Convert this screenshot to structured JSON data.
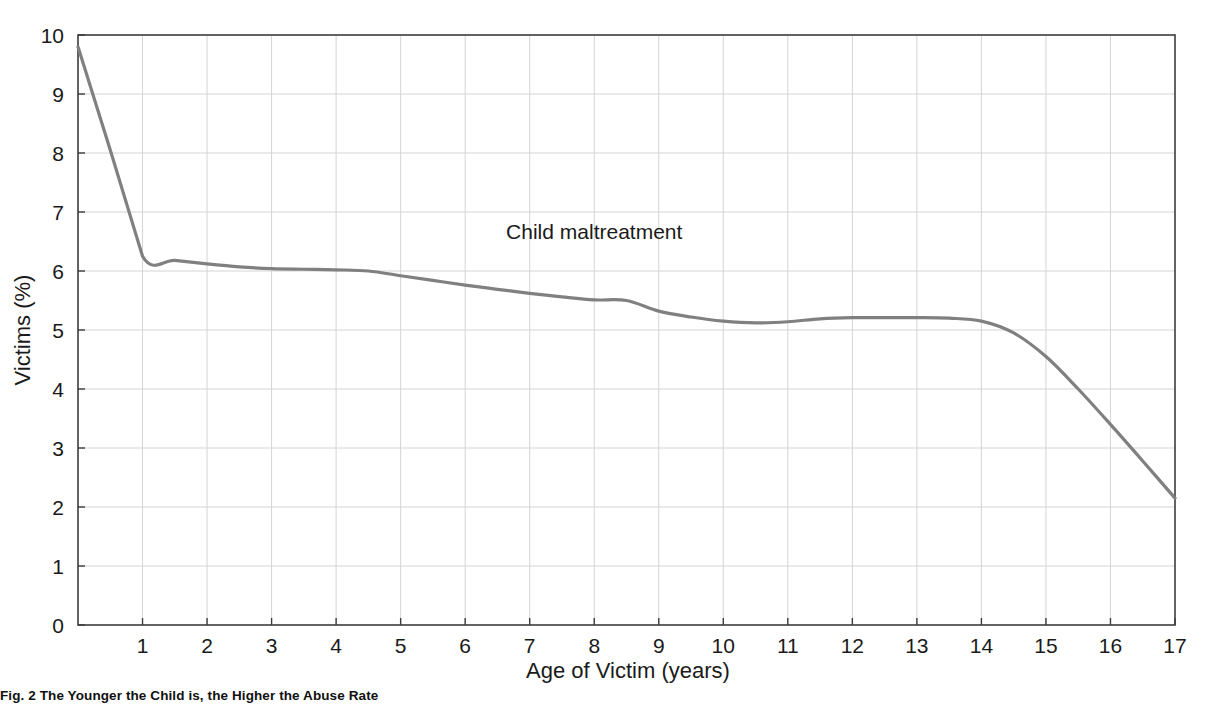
{
  "chart_data": {
    "type": "line",
    "title": "",
    "xlabel": "Age of Victim (years)",
    "ylabel": "Victims (%)",
    "xlim": [
      0,
      17
    ],
    "ylim": [
      0,
      10
    ],
    "xticks": [
      1,
      2,
      3,
      4,
      5,
      6,
      7,
      8,
      9,
      10,
      11,
      12,
      13,
      14,
      15,
      16,
      17
    ],
    "yticks": [
      0,
      1,
      2,
      3,
      4,
      5,
      6,
      7,
      8,
      9,
      10
    ],
    "grid": true,
    "legend_position": "inline-annotation",
    "series": [
      {
        "name": "Child maltreatment",
        "color": "#808080",
        "x": [
          0,
          0.5,
          1,
          1.5,
          2,
          2.5,
          3,
          3.5,
          4,
          4.5,
          5,
          5.5,
          6,
          6.5,
          7,
          7.5,
          8,
          8.5,
          9,
          9.5,
          10,
          10.5,
          11,
          11.5,
          12,
          12.5,
          13,
          13.5,
          14,
          14.5,
          15,
          15.5,
          16,
          16.5,
          17
        ],
        "y": [
          9.8,
          8.05,
          6.25,
          6.18,
          6.12,
          6.07,
          6.04,
          6.03,
          6.02,
          6.0,
          5.92,
          5.84,
          5.76,
          5.69,
          5.62,
          5.56,
          5.51,
          5.5,
          5.32,
          5.22,
          5.15,
          5.12,
          5.14,
          5.19,
          5.21,
          5.21,
          5.21,
          5.2,
          5.15,
          4.95,
          4.55,
          4.0,
          3.4,
          2.78,
          2.15
        ]
      }
    ],
    "annotations": [
      {
        "text": "Child maltreatment",
        "x": 8.0,
        "y": 6.55
      }
    ]
  },
  "figure": {
    "caption": "Fig. 2    The Younger the Child is, the Higher the Abuse Rate"
  },
  "axis": {
    "x_title": "Age of Victim (years)",
    "y_title": "Victims (%)",
    "x_tick_labels": [
      "1",
      "2",
      "3",
      "4",
      "5",
      "6",
      "7",
      "8",
      "9",
      "10",
      "11",
      "12",
      "13",
      "14",
      "15",
      "16",
      "17"
    ],
    "y_tick_labels": [
      "0",
      "1",
      "2",
      "3",
      "4",
      "5",
      "6",
      "7",
      "8",
      "9",
      "10"
    ]
  },
  "colors": {
    "series_line": "#808080",
    "grid": "#d4d4d4",
    "frame": "#3c3c3c",
    "text": "#1a1a1a",
    "background": "#ffffff"
  }
}
